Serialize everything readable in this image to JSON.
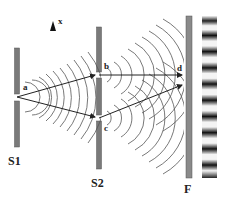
{
  "diagram": {
    "axis_label": "x",
    "barriers": [
      {
        "id": "S1",
        "label": "S1",
        "slits": [
          "a"
        ]
      },
      {
        "id": "S2",
        "label": "S2",
        "slits": [
          "b",
          "c"
        ]
      }
    ],
    "screen": {
      "label": "F"
    },
    "points": {
      "a": "a",
      "b": "b",
      "c": "c",
      "d": "d"
    },
    "rays": [
      {
        "from": "a",
        "to": "b"
      },
      {
        "from": "a",
        "to": "c"
      },
      {
        "from": "b",
        "to": "d"
      },
      {
        "from": "c",
        "to": "d"
      }
    ],
    "fringe_pattern": {
      "bright_fringes": 10,
      "dark_fringes": 10
    },
    "colors": {
      "barrier": "#7a7a7a",
      "line": "#333333",
      "wave": "#555555",
      "fringe_dark": "#111111",
      "fringe_light": "#f4f4f4"
    }
  }
}
